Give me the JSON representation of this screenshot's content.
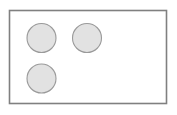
{
  "diagram": {
    "canvas": {
      "width": 177,
      "height": 115,
      "background_color": "#ffffff"
    },
    "container": {
      "shape_name": "rectangle",
      "x": 9.5,
      "y": 10.5,
      "width": 157,
      "height": 93,
      "fill_color": "#ffffff",
      "stroke_color": "#808080",
      "stroke_width": 1.6
    },
    "circles": [
      {
        "label": "circle-top-left",
        "cx": 41.5,
        "cy": 38,
        "r": 14.5,
        "fill_color": "#e2e2e2",
        "stroke_color": "#9a9a9a",
        "stroke_width": 1.1
      },
      {
        "label": "circle-top-right",
        "cx": 87,
        "cy": 38,
        "r": 14.5,
        "fill_color": "#e2e2e2",
        "stroke_color": "#9a9a9a",
        "stroke_width": 1.1
      },
      {
        "label": "circle-bottom-left",
        "cx": 41.5,
        "cy": 78.5,
        "r": 14.5,
        "fill_color": "#e2e2e2",
        "stroke_color": "#9a9a9a",
        "stroke_width": 1.1
      }
    ],
    "circle_count": 3
  }
}
